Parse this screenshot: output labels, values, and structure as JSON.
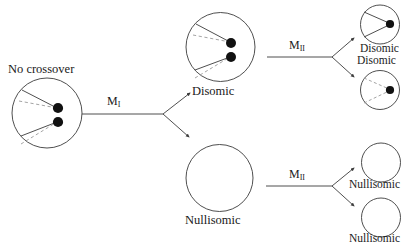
{
  "diagram": {
    "labels": {
      "no_crossover": "No crossover",
      "disomic_mid": "Disomic",
      "nullisomic_mid": "Nullisomic",
      "disomic_top_right": "Disomic",
      "disomic_second_right": "Disomic",
      "nullisomic_third_right": "Nullisomic",
      "nullisomic_bottom_right": "Nullisomic",
      "meiosis_one": "M",
      "meiosis_one_sub": "I",
      "meiosis_two_upper": "M",
      "meiosis_two_upper_sub": "II",
      "meiosis_two_lower": "M",
      "meiosis_two_lower_sub": "II"
    },
    "colors": {
      "stroke": "#3b3b3b",
      "dashed_stroke": "#9a9a9a",
      "dot_fill": "#111111",
      "text": "#1a1a1a",
      "background": "#ffffff"
    },
    "cells": [
      {
        "name": "no-crossover-cell",
        "label": "No crossover",
        "cx": 47,
        "cy": 113,
        "r": 35,
        "dots": 2,
        "chromatids": "two-solid-two-dashed"
      },
      {
        "name": "disomic-cell-mid",
        "label": "Disomic",
        "cx": 220.5,
        "cy": 47,
        "r": 34.5,
        "dots": 2,
        "chromatids": "two-solid-two-dashed"
      },
      {
        "name": "nullisomic-cell-mid",
        "label": "Nullisomic",
        "cx": 219.5,
        "cy": 178,
        "r": 33.5,
        "dots": 0,
        "chromatids": "none"
      },
      {
        "name": "disomic-gamete-1",
        "label": "Disomic",
        "cx": 380,
        "cy": 24.5,
        "r": 19.5,
        "dots": 1,
        "chromatids": "one-solid"
      },
      {
        "name": "disomic-gamete-2",
        "label": "Disomic",
        "cx": 380,
        "cy": 90,
        "r": 19.5,
        "dots": 1,
        "chromatids": "one-dashed"
      },
      {
        "name": "nullisomic-gamete-1",
        "label": "Nullisomic",
        "cx": 381,
        "cy": 162.5,
        "r": 19.5,
        "dots": 0,
        "chromatids": "none"
      },
      {
        "name": "nullisomic-gamete-2",
        "label": "Nullisomic",
        "cx": 381,
        "cy": 217.5,
        "r": 19.5,
        "dots": 0,
        "chromatids": "none"
      }
    ]
  }
}
